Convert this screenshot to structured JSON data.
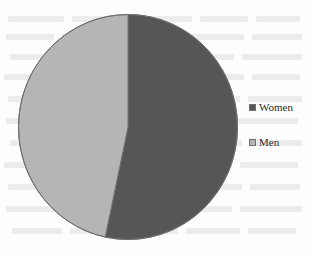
{
  "figure": {
    "name": "pie-chart-figure",
    "background_color": "#fdfdfd"
  },
  "legend": {
    "position": "right",
    "items": [
      {
        "label": "Women",
        "color": "#565656",
        "swatch_name": "legend-swatch-women"
      },
      {
        "label": "Men",
        "color": "#b5b5b5",
        "swatch_name": "legend-swatch-men"
      }
    ]
  },
  "chart_data": {
    "type": "pie",
    "title": "",
    "subtitle": "",
    "xlabel": "",
    "ylabel": "",
    "categories": [
      "Women",
      "Men"
    ],
    "values": [
      53,
      47
    ],
    "units": "percent",
    "colors": [
      "#565656",
      "#b5b5b5"
    ],
    "slices": [
      {
        "label": "Women",
        "value": 53,
        "color": "#565656",
        "start_angle_deg": 0,
        "end_angle_deg": 192
      },
      {
        "label": "Men",
        "value": 47,
        "color": "#b5b5b5",
        "start_angle_deg": 192,
        "end_angle_deg": 360
      }
    ],
    "start_angle_deg": 0,
    "direction": "clockwise",
    "grid": false,
    "legend_position": "right",
    "data_labels_shown": false,
    "outline_color": "#6f6f6f"
  }
}
